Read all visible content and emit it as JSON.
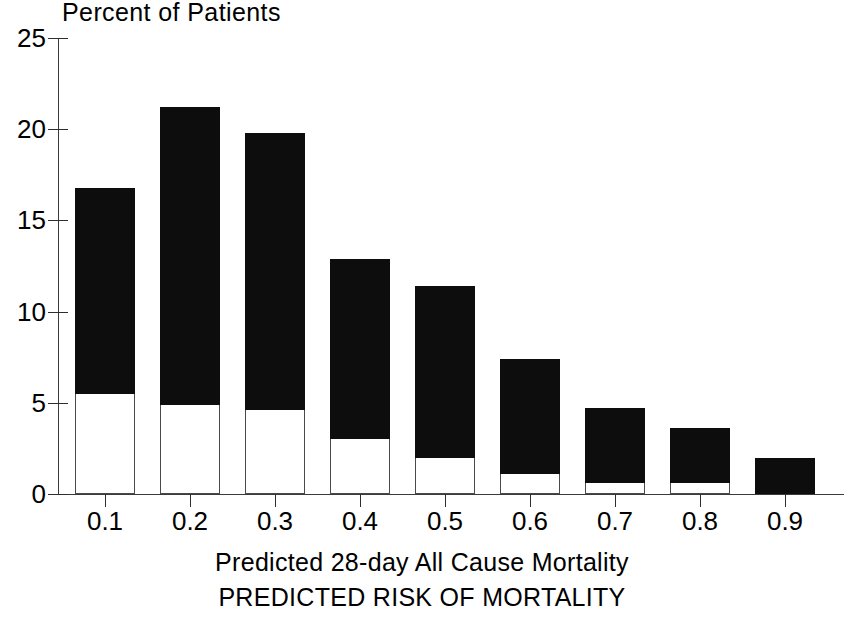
{
  "chart_data": {
    "type": "bar",
    "title": "Percent of Patients",
    "subtitle": "",
    "xlabel": "Predicted 28-day All Cause Mortality",
    "xlabel2": "PREDICTED RISK OF MORTALITY",
    "ylabel": "Percent of Patients",
    "ylim": [
      0,
      25
    ],
    "xlim": [
      0.05,
      0.95
    ],
    "grid": false,
    "legend": null,
    "stacked": true,
    "categories": [
      "0.1",
      "0.2",
      "0.3",
      "0.4",
      "0.5",
      "0.6",
      "0.7",
      "0.8",
      "0.9"
    ],
    "ytick_labels": [
      "0",
      "5",
      "10",
      "15",
      "20",
      "25"
    ],
    "ytick_values": [
      0,
      5,
      10,
      15,
      20,
      25
    ],
    "xtick_labels": [
      "0.1",
      "0.2",
      "0.3",
      "0.4",
      "0.5",
      "0.6",
      "0.7",
      "0.8",
      "0.9"
    ],
    "series": [
      {
        "name": "Observed deaths (lower, white)",
        "color": "#ffffff",
        "values": [
          5.5,
          4.9,
          4.6,
          3.0,
          2.0,
          1.1,
          0.6,
          0.6,
          0.0
        ]
      },
      {
        "name": "Survivors (upper, black)",
        "color": "#0d0d0d",
        "values": [
          11.3,
          16.3,
          15.2,
          9.9,
          9.4,
          6.3,
          4.1,
          3.0,
          2.0
        ]
      }
    ],
    "totals": [
      16.8,
      21.2,
      19.8,
      12.9,
      11.4,
      7.4,
      4.7,
      3.6,
      2.0
    ]
  },
  "axes": {
    "y_title": "Percent of Patients",
    "x_caption": "Predicted 28-day All Cause Mortality",
    "x_subcaption": "PREDICTED RISK OF MORTALITY"
  },
  "colors": {
    "bar_fill_top": "#0d0d0d",
    "bar_fill_bottom": "#ffffff",
    "bar_outline": "#4a4a4a",
    "axis": "#3b3b3b",
    "text": "#000000",
    "background": "#ffffff"
  }
}
